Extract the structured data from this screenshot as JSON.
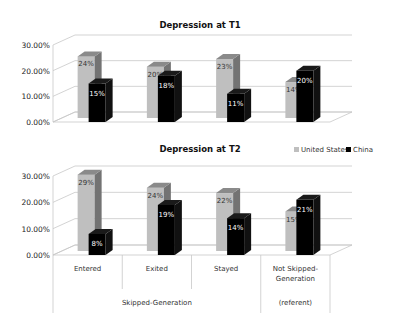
{
  "chart_data": [
    {
      "type": "bar",
      "title": "Depression at T1",
      "categories": [
        "Entered",
        "Exited",
        "Stayed",
        "Not Skipped-Generation"
      ],
      "series": [
        {
          "name": "United States",
          "values": [
            24,
            20,
            23,
            14
          ],
          "color": "#bfbfbf"
        },
        {
          "name": "China",
          "values": [
            15,
            18,
            11,
            20
          ],
          "color": "#000000"
        }
      ],
      "data_labels": {
        "United States": [
          "24%",
          "20%",
          "23%",
          "14%"
        ],
        "China": [
          "15%",
          "18%",
          "11%",
          "20%"
        ]
      },
      "yticks": [
        "0.00%",
        "10.00%",
        "20.00%",
        "30.00%"
      ],
      "ylim": [
        0,
        30
      ],
      "xlabel": "",
      "ylabel": "",
      "grid": true,
      "style": "3d-clustered-column"
    },
    {
      "type": "bar",
      "title": "Depression at T2",
      "categories": [
        "Entered",
        "Exited",
        "Stayed",
        "Not Skipped-Generation"
      ],
      "series": [
        {
          "name": "United States",
          "values": [
            29,
            24,
            22,
            15
          ],
          "color": "#bfbfbf"
        },
        {
          "name": "China",
          "values": [
            8,
            19,
            14,
            21
          ],
          "color": "#000000"
        }
      ],
      "data_labels": {
        "United States": [
          "29%",
          "24%",
          "22%",
          "15%"
        ],
        "China": [
          "8%",
          "19%",
          "14%",
          "21%"
        ]
      },
      "yticks": [
        "0.00%",
        "10.00%",
        "20.00%",
        "30.00%"
      ],
      "ylim": [
        0,
        30
      ],
      "xlabel": "",
      "ylabel": "",
      "grid": true,
      "legend": {
        "position": "top-right",
        "entries": [
          "United States",
          "China"
        ]
      },
      "style": "3d-clustered-column"
    }
  ],
  "x_axis": {
    "categories": [
      "Entered",
      "Exited",
      "Stayed",
      "Not Skipped-\nGeneration"
    ],
    "groups": [
      {
        "label": "Skipped-Generation",
        "span": [
          0,
          2
        ]
      },
      {
        "label": "(referent)",
        "span": [
          3,
          3
        ]
      }
    ]
  },
  "legend": {
    "entries": [
      {
        "label": "United States",
        "color": "#bfbfbf"
      },
      {
        "label": "China",
        "color": "#000000"
      }
    ]
  }
}
